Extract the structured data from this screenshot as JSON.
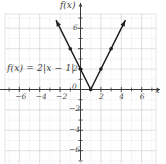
{
  "figure": {
    "equation_label": "f(x) = 2|x − 1|",
    "y_axis_label": "f(x)",
    "x_axis_label": "x"
  },
  "chart_data": {
    "type": "line",
    "title": "",
    "subtitle": "",
    "xlabel": "x",
    "ylabel": "f(x)",
    "function": "f(x) = 2|x - 1|",
    "xlim": [
      -7.5,
      7.5
    ],
    "ylim": [
      -7.5,
      7.5
    ],
    "grid": true,
    "grid_minor_step": 1,
    "grid_major_step": 2,
    "legend": "none",
    "xticks": [
      -6,
      -4,
      -2,
      0,
      2,
      4,
      6
    ],
    "xticklabels": [
      "-6",
      "-4",
      "-2",
      "0",
      "2",
      "4",
      "6"
    ],
    "yticks": [
      -6,
      -4,
      -2,
      2,
      6
    ],
    "yticklabels": [
      "-6",
      "-4",
      "-2",
      "2",
      "6"
    ],
    "vertex": [
      1,
      0
    ],
    "series": [
      {
        "name": "f(x) = 2|x - 1|",
        "color": "#231f20",
        "arrow_start": true,
        "arrow_end": true,
        "x": [
          -2.4,
          1,
          4.4
        ],
        "y": [
          6.8,
          0,
          6.8
        ]
      }
    ],
    "points": [
      {
        "x": -1,
        "y": 4
      },
      {
        "x": 0,
        "y": 2
      },
      {
        "x": 1,
        "y": 0
      },
      {
        "x": 2,
        "y": 2
      },
      {
        "x": 3,
        "y": 4
      }
    ]
  }
}
